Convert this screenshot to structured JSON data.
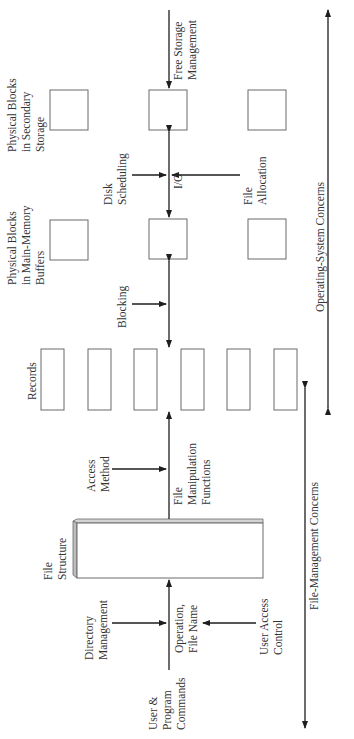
{
  "diagram": {
    "type": "block-diagram",
    "orientation": "rotated-90-ccw",
    "nodes": {
      "physical_blocks_secondary": [
        "Physical Blocks",
        "in Secondary",
        "Storage"
      ],
      "physical_blocks_main_memory": [
        "Physical Blocks",
        "in Main-Memory",
        "Buffers"
      ],
      "records": "Records",
      "file_structure": [
        "File",
        "Structure"
      ]
    },
    "labels": {
      "free_storage_management": [
        "Free Storage",
        "Management"
      ],
      "disk_scheduling": [
        "Disk",
        "Scheduling"
      ],
      "io": "I/O",
      "file_allocation": [
        "File",
        "Allocation"
      ],
      "blocking": "Blocking",
      "access_method": [
        "Access",
        "Method"
      ],
      "file_manipulation_functions": [
        "File",
        "Manipulation",
        "Functions"
      ],
      "directory_management": [
        "Directory",
        "Management"
      ],
      "operation_file_name": [
        "Operation,",
        "File Name"
      ],
      "user_access_control": [
        "User Access",
        "Control"
      ],
      "user_program_commands": [
        "User &",
        "Program",
        "Commands"
      ]
    },
    "axes": {
      "os_concerns": "Operating-System Concerns",
      "file_management_concerns": "File-Management Concerns"
    },
    "colors": {
      "line": "#1e1e1e",
      "box_stroke": "#6a6a6a",
      "box_edge": "#cfcfcf",
      "text": "#333333"
    }
  }
}
